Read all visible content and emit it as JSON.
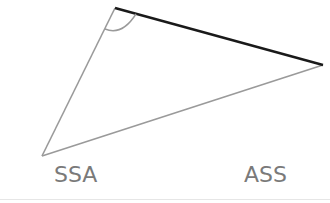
{
  "diagram": {
    "labels": {
      "left": "SSA",
      "right": "ASS"
    },
    "colors": {
      "thin_side": "#9a9a9a",
      "thick_side": "#1a1a1a",
      "label": "#7a7a7a",
      "arc": "#9a9a9a"
    },
    "vertices": {
      "top": [
        115,
        8
      ],
      "right": [
        323,
        65
      ],
      "bottom_left": [
        42,
        156
      ]
    }
  }
}
